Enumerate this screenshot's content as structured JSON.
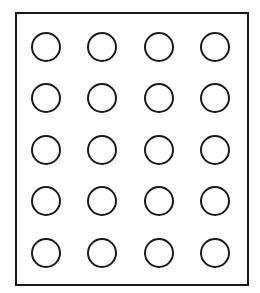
{
  "diagram": {
    "type": "circle-grid",
    "rows": 5,
    "columns": 4,
    "stroke_color": "#1a1a1a",
    "fill_color": "#ffffff",
    "column_centers": [
      46,
      102,
      159,
      215
    ],
    "row_centers": [
      47,
      98,
      150,
      201,
      253
    ],
    "radius": 14
  }
}
